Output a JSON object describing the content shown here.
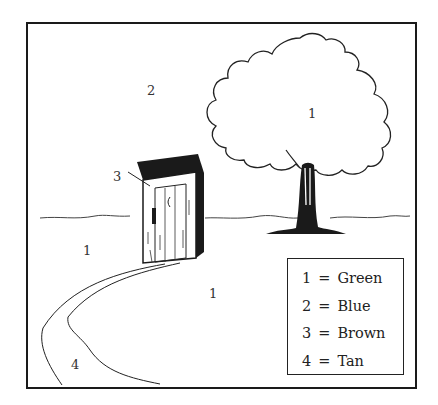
{
  "illustration": {
    "subject": "coloring page: outhouse, tree and path",
    "region_labels": [
      {
        "id": "sky",
        "number": "2",
        "x": 148,
        "y": 84
      },
      {
        "id": "tree-canopy",
        "number": "1",
        "x": 309,
        "y": 108
      },
      {
        "id": "outhouse",
        "number": "3",
        "x": 113,
        "y": 172
      },
      {
        "id": "grass-left",
        "number": "1",
        "x": 83,
        "y": 245
      },
      {
        "id": "grass-right",
        "number": "1",
        "x": 210,
        "y": 288
      },
      {
        "id": "path",
        "number": "4",
        "x": 71,
        "y": 359
      }
    ]
  },
  "legend": {
    "items": [
      {
        "number": "1",
        "equals": "=",
        "color_name": "Green",
        "color": "#3a9a3a"
      },
      {
        "number": "2",
        "equals": "=",
        "color_name": "Blue",
        "color": "#3a6ad0"
      },
      {
        "number": "3",
        "equals": "=",
        "color_name": "Brown",
        "color": "#7a4a20"
      },
      {
        "number": "4",
        "equals": "=",
        "color_name": "Tan",
        "color": "#d2b48c"
      }
    ]
  }
}
